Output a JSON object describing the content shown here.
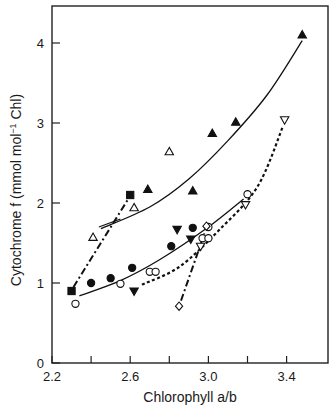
{
  "chart_data": {
    "type": "scatter",
    "title": "",
    "xlabel": "Chlorophyll a/b",
    "ylabel": "Cytochrome f (mmol mol⁻¹ Chl)",
    "xlim": [
      2.2,
      3.6
    ],
    "ylim": [
      0,
      4.4
    ],
    "x_ticks": [
      2.2,
      2.4,
      2.6,
      2.8,
      3.0,
      3.2,
      3.4
    ],
    "x_tick_labels": [
      "2.2",
      "2.6",
      "3.0",
      "3.4"
    ],
    "y_ticks": [
      0,
      1,
      2,
      3,
      4
    ],
    "y_tick_labels": [
      "0",
      "1",
      "2",
      "3",
      "4"
    ],
    "grid": false,
    "legend": null,
    "series": [
      {
        "name": "filled squares",
        "marker": "square-filled",
        "line": "dash-dot",
        "points": [
          [
            2.3,
            0.9
          ],
          [
            2.6,
            2.1
          ]
        ]
      },
      {
        "name": "open triangles",
        "marker": "triangle-up-open",
        "line": "solid-short",
        "points": [
          [
            2.41,
            1.57
          ],
          [
            2.62,
            1.94
          ],
          [
            2.8,
            2.64
          ]
        ]
      },
      {
        "name": "filled triangles",
        "marker": "triangle-up-filled",
        "line": "solid-curve",
        "points": [
          [
            2.69,
            2.17
          ],
          [
            2.92,
            2.15
          ],
          [
            3.02,
            2.87
          ],
          [
            3.14,
            3.01
          ],
          [
            3.48,
            4.1
          ]
        ]
      },
      {
        "name": "filled circles",
        "marker": "circle-filled",
        "line": "none",
        "points": [
          [
            2.4,
            1.0
          ],
          [
            2.5,
            1.06
          ],
          [
            2.61,
            1.19
          ],
          [
            2.81,
            1.46
          ],
          [
            2.92,
            1.69
          ]
        ]
      },
      {
        "name": "filled inverted triangles",
        "marker": "triangle-down-filled",
        "line": "none",
        "points": [
          [
            2.62,
            0.9
          ],
          [
            2.84,
            1.67
          ],
          [
            2.91,
            1.55
          ]
        ]
      },
      {
        "name": "open circles",
        "marker": "circle-open",
        "line": "solid",
        "points": [
          [
            2.32,
            0.74
          ],
          [
            2.55,
            0.99
          ],
          [
            2.7,
            1.14
          ],
          [
            2.73,
            1.14
          ],
          [
            2.97,
            1.56
          ],
          [
            3.0,
            1.56
          ],
          [
            3.0,
            1.7
          ],
          [
            3.2,
            2.11
          ]
        ]
      },
      {
        "name": "open inverted triangles",
        "marker": "triangle-down-open",
        "line": "dotted-bold",
        "points": [
          [
            2.96,
            1.46
          ],
          [
            3.19,
            1.98
          ],
          [
            3.39,
            3.04
          ]
        ]
      },
      {
        "name": "open diamonds",
        "marker": "diamond-open",
        "line": "dash-dot",
        "points": [
          [
            2.85,
            0.71
          ],
          [
            2.99,
            1.71
          ]
        ]
      }
    ],
    "curves": [
      {
        "name": "filled-triangle fit",
        "style": "solid",
        "points": [
          [
            2.45,
            1.68
          ],
          [
            2.7,
            1.95
          ],
          [
            2.9,
            2.3
          ],
          [
            3.1,
            2.78
          ],
          [
            3.3,
            3.35
          ],
          [
            3.48,
            4.03
          ]
        ]
      },
      {
        "name": "open-triangle segment",
        "style": "solid",
        "points": [
          [
            2.44,
            1.7
          ],
          [
            2.55,
            1.8
          ]
        ]
      },
      {
        "name": "open-circle fit",
        "style": "solid",
        "points": [
          [
            2.34,
            0.84
          ],
          [
            2.55,
            1.03
          ],
          [
            2.75,
            1.29
          ],
          [
            3.0,
            1.7
          ],
          [
            3.18,
            2.05
          ]
        ]
      },
      {
        "name": "dotted fit",
        "style": "dotted",
        "points": [
          [
            2.66,
            0.98
          ],
          [
            2.85,
            1.2
          ],
          [
            3.05,
            1.65
          ],
          [
            3.25,
            2.2
          ],
          [
            3.38,
            2.95
          ]
        ]
      },
      {
        "name": "dash-dot square",
        "style": "dashdot",
        "points": [
          [
            2.31,
            0.95
          ],
          [
            2.59,
            2.05
          ]
        ]
      },
      {
        "name": "dash-dot diamond",
        "style": "dashdot",
        "points": [
          [
            2.86,
            0.78
          ],
          [
            2.98,
            1.62
          ]
        ]
      }
    ]
  },
  "labels": {
    "xlabel": "Chlorophyll a/b",
    "ylabel": "Cytochrome f (mmol mol⁻¹ Chl)"
  }
}
